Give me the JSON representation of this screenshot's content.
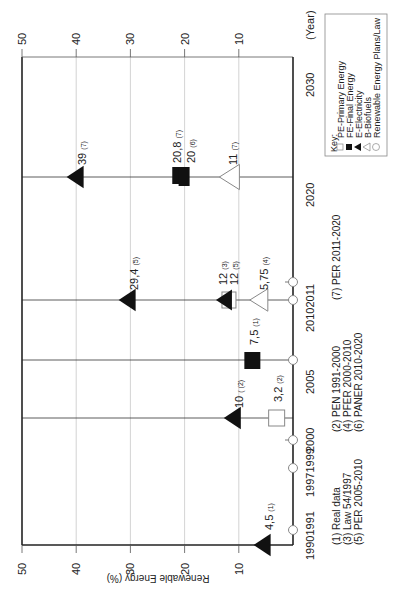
{
  "chart_data": {
    "type": "scatter",
    "orientation": "rotated-90-clockwise",
    "title": "",
    "xlabel": "(Year)",
    "ylabel": "Renewable  Energy (%)",
    "ylim": [
      0,
      50
    ],
    "y_ticks": [
      "10",
      "20",
      "30",
      "40",
      "50"
    ],
    "x_ticks": [
      {
        "label": "1990",
        "year": 1990
      },
      {
        "label": "1991",
        "year": 1991
      },
      {
        "label": "1997",
        "year": 1997
      },
      {
        "label": "1999",
        "year": 1999
      },
      {
        "label": "2000",
        "year": 2000
      },
      {
        "label": "2005",
        "year": 2005
      },
      {
        "label": "2010",
        "year": 2010
      },
      {
        "label": "2011",
        "year": 2011
      },
      {
        "label": "2020",
        "year": 2020
      },
      {
        "label": "2030",
        "year": 2030
      }
    ],
    "x_tick_groups": [
      "19901991",
      "19971999",
      "2000",
      "2005",
      "20102011",
      "2020",
      "2030",
      "(Year)"
    ],
    "plan_markers_years": [
      1991,
      1997,
      1999,
      2005,
      2010,
      2011
    ],
    "grid": true,
    "legend": {
      "title": "Key:",
      "entries": [
        {
          "symbol": "open-square",
          "label": "PE-Primary Energy"
        },
        {
          "symbol": "filled-square",
          "label": "FE-Final Energy"
        },
        {
          "symbol": "filled-triangle",
          "label": "E-Electricity"
        },
        {
          "symbol": "open-triangle",
          "label": "B-Biofuels"
        },
        {
          "symbol": "open-circle",
          "label": "Renewable Energy Plans/Law"
        }
      ]
    },
    "series": [
      {
        "name": "PE-Primary Energy",
        "points": [
          {
            "year": 2000,
            "value": 3.2,
            "label": "3,2",
            "ref": "(2)"
          },
          {
            "year": 2010,
            "value": 12,
            "label": "12",
            "ref": "(3)"
          }
        ]
      },
      {
        "name": "FE-Final Energy",
        "points": [
          {
            "year": 2005,
            "value": 7.5,
            "label": "7,5",
            "ref": "(1)"
          },
          {
            "year": 2020,
            "value": 20.8,
            "label": "20,8",
            "ref": "(7)"
          },
          {
            "year": 2020,
            "value": 20,
            "label": "20",
            "ref": "(6)"
          }
        ]
      },
      {
        "name": "E-Electricity",
        "points": [
          {
            "year": 1990,
            "value": 4.5,
            "label": "4,5",
            "ref": "(1)"
          },
          {
            "year": 2000,
            "value": 10,
            "label": "10",
            "ref": "( (2)"
          },
          {
            "year": 2010,
            "value": 29.4,
            "label": "29,4",
            "ref": "(5)"
          },
          {
            "year": 2010,
            "value": 12,
            "label": "12",
            "ref": "(5)"
          },
          {
            "year": 2020,
            "value": 39,
            "label": "39",
            "ref": "(7)"
          }
        ]
      },
      {
        "name": "B-Biofuels",
        "points": [
          {
            "year": 2010,
            "value": 5.75,
            "label": "5,75",
            "ref": "(4)"
          },
          {
            "year": 2020,
            "value": 11,
            "label": "11",
            "ref": "(7)"
          }
        ]
      }
    ],
    "footnotes": [
      "(1) Real data",
      "(2) PEN 1991-2000",
      "(3) Law 54/1997",
      "(4) PFER 2000-2010",
      "(5) PER 2005-2010",
      "(6) PANER 2010-2020",
      "(7) PER 2011-2020"
    ]
  },
  "colors": {
    "axis": "#222222",
    "grid": "#c8c8c8",
    "marker_fill": "#111111",
    "open_marker_stroke": "#888888"
  }
}
